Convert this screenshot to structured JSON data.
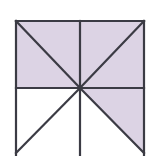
{
  "figure": {
    "canvas": {
      "width": 154,
      "height": 156,
      "background": "#ffffff"
    },
    "colors": {
      "shade": "#dcd3e4",
      "shade_alt": "#d8cfe2",
      "line": "#3b3b44",
      "unshaded": "#ffffff"
    },
    "square": {
      "left": 16,
      "top": 21,
      "right": 144,
      "bottom": 153,
      "cropped_at_bottom": true,
      "center_x": 80,
      "center_y": 88
    },
    "line_width": 2.2,
    "regions": [
      {
        "id": "top-left-upper",
        "label": "top-left upper triangle",
        "shaded": true,
        "points": "16,21 144,21 80,88 16,21"
      },
      {
        "id": "top-left-lower",
        "label": "top-left lower triangle",
        "shaded": true,
        "points": "16,21 80,88 16,88"
      },
      {
        "id": "top-right-upper",
        "label": "top-right upper triangle",
        "shaded": true,
        "points": "80,21 144,21 80,88"
      },
      {
        "id": "top-right-lower",
        "label": "top-right lower triangle",
        "shaded": true,
        "points": "144,21 144,88 80,88"
      },
      {
        "id": "bottom-right-upper",
        "label": "bottom-right upper triangle",
        "shaded": true,
        "points": "80,88 144,88 144,153"
      },
      {
        "id": "bottom-right-lower",
        "label": "bottom-right lower triangle",
        "shaded": false,
        "points": "80,88 144,153 80,153"
      },
      {
        "id": "bottom-left-upper",
        "label": "bottom-left upper triangle",
        "shaded": false,
        "points": "16,88 80,88 16,153"
      },
      {
        "id": "bottom-left-lower",
        "label": "bottom-left lower triangle",
        "shaded": false,
        "points": "16,153 80,88 80,153"
      }
    ],
    "lines": [
      {
        "id": "edge-top",
        "label": "top edge",
        "x1": 16,
        "y1": 21,
        "x2": 144,
        "y2": 21
      },
      {
        "id": "edge-left",
        "label": "left edge",
        "x1": 16,
        "y1": 21,
        "x2": 16,
        "y2": 156
      },
      {
        "id": "edge-right",
        "label": "right edge",
        "x1": 144,
        "y1": 21,
        "x2": 144,
        "y2": 156
      },
      {
        "id": "midline-vertical",
        "label": "vertical midline",
        "x1": 80,
        "y1": 21,
        "x2": 80,
        "y2": 156
      },
      {
        "id": "midline-horizontal",
        "label": "horizontal midline",
        "x1": 16,
        "y1": 88,
        "x2": 144,
        "y2": 88
      },
      {
        "id": "diagonal-tl-center",
        "label": "diagonal top-left to center",
        "x1": 16,
        "y1": 21,
        "x2": 80,
        "y2": 88
      },
      {
        "id": "diagonal-tr-center",
        "label": "diagonal top-right to center",
        "x1": 144,
        "y1": 21,
        "x2": 80,
        "y2": 88
      },
      {
        "id": "diagonal-bl-center",
        "label": "diagonal bottom-left to center",
        "x1": 16,
        "y1": 153,
        "x2": 80,
        "y2": 88
      },
      {
        "id": "diagonal-br-center",
        "label": "diagonal bottom-right to center",
        "x1": 144,
        "y1": 153,
        "x2": 80,
        "y2": 88
      }
    ]
  }
}
